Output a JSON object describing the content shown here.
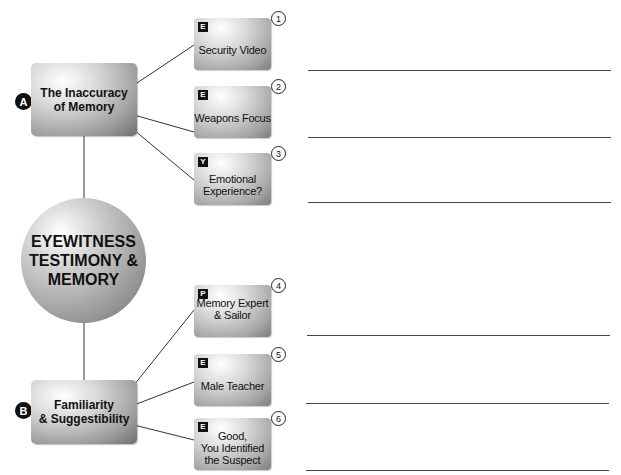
{
  "diagram": {
    "center": {
      "label_lines": [
        "EYEWITNESS",
        "TESTIMONY &",
        "MEMORY"
      ]
    },
    "topics": [
      {
        "letter": "A",
        "label_lines": [
          "The Inaccuracy",
          "of Memory"
        ]
      },
      {
        "letter": "B",
        "label_lines": [
          "Familiarity",
          "& Suggestibility"
        ]
      }
    ],
    "cards": [
      {
        "number": "1",
        "tag": "E",
        "label_lines": [
          "Security Video"
        ]
      },
      {
        "number": "2",
        "tag": "E",
        "label_lines": [
          "Weapons Focus"
        ]
      },
      {
        "number": "3",
        "tag": "Y",
        "label_lines": [
          "Emotional",
          "Experience?"
        ]
      },
      {
        "number": "4",
        "tag": "P",
        "label_lines": [
          "Memory Expert",
          "& Sailor"
        ]
      },
      {
        "number": "5",
        "tag": "E",
        "label_lines": [
          "Male Teacher"
        ]
      },
      {
        "number": "6",
        "tag": "E",
        "label_lines": [
          "Good,",
          "You Identified",
          "the Suspect"
        ]
      }
    ],
    "answer_lines_count": 6
  }
}
